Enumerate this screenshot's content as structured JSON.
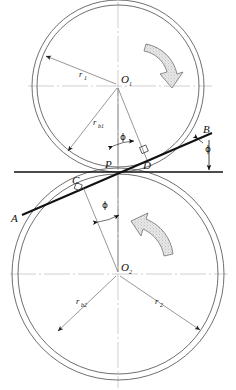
{
  "figure": {
    "type": "engineering-diagram"
  },
  "labels": {
    "center_top": "O",
    "center_top_sub": "1",
    "center_bottom": "O",
    "center_bottom_sub": "2",
    "pitch_point": "P",
    "point_a": "A",
    "point_b": "B",
    "point_c": "C",
    "point_d": "D",
    "radius_top_pitch": "r",
    "radius_top_pitch_sub": "1",
    "radius_top_base": "r",
    "radius_top_base_sub": "b1",
    "radius_bottom_pitch": "r",
    "radius_bottom_pitch_sub": "2",
    "radius_bottom_base": "r",
    "radius_bottom_base_sub": "b2",
    "angle_top": "ϕ",
    "angle_right": "ϕ",
    "angle_bottom": "ϕ"
  },
  "colors": {
    "outline": "#4a4a4a",
    "heavy_line": "#111111",
    "thin_line": "#6b6b6b",
    "centerline": "#9a9a9a",
    "text": "#111111",
    "arrow_fill": "#cfcfcf",
    "arrow_stroke": "#6b6b6b",
    "background": "#ffffff"
  },
  "geometry": {
    "top_center": {
      "x": 118,
      "y": 86
    },
    "bottom_center": {
      "x": 118,
      "y": 274
    },
    "pitch_point": {
      "x": 118,
      "y": 172
    },
    "top_pitch_radius": 86,
    "top_base_radius": 81,
    "bottom_pitch_radius": 106,
    "bottom_base_radius": 100,
    "pressure_angle_deg": 18,
    "tangent_line_y": 172,
    "tangent_line_x_start": 14,
    "tangent_line_x_end": 223
  },
  "annotations": {
    "rotation_top": "clockwise-curved-arrow",
    "rotation_bottom": "counterclockwise-curved-arrow",
    "right_angle_marks": [
      "D",
      "C"
    ]
  }
}
